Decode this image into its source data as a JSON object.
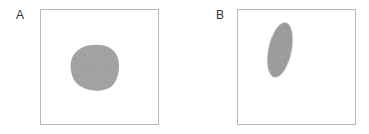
{
  "panels": [
    {
      "label": "A",
      "shape": "round-cell",
      "fill_color": "#9a9a9a"
    },
    {
      "label": "B",
      "shape": "elongated-cell",
      "fill_color": "#929292"
    }
  ],
  "colors": {
    "border": "#b8b8b8",
    "label": "#333333",
    "background": "#ffffff"
  }
}
